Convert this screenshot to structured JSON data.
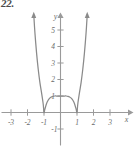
{
  "figure": {
    "exercise_number": "22.",
    "background_color": "#ffffff",
    "curve_color": "#8a8a8a",
    "axis_color": "#9a9a9a",
    "label_color": "#6b6b6b"
  },
  "chart_data": {
    "type": "line",
    "title": "",
    "subtitle": "",
    "xlabel": "x",
    "ylabel": "y",
    "xlim": [
      -3.6,
      3.9
    ],
    "ylim": [
      -1.8,
      6.3
    ],
    "grid": false,
    "legend": null,
    "x_ticks": [
      -3,
      -2,
      -1,
      1,
      2,
      3
    ],
    "x_tick_labels": [
      "-3",
      "-2",
      "-1",
      "1",
      "2",
      "3"
    ],
    "y_ticks": [
      -1,
      1,
      2,
      3,
      4,
      5
    ],
    "y_tick_labels": [
      "-1",
      "1",
      "2",
      "3",
      "4",
      "5"
    ],
    "series": [
      {
        "name": "quartic",
        "description": "W-shaped quartic with double roots at x=-1 and x=1 and a local maximum at (0, 1)",
        "x": [
          -1.62,
          -1.55,
          -1.45,
          -1.35,
          -1.25,
          -1.15,
          -1.05,
          -1.0,
          -0.95,
          -0.85,
          -0.75,
          -0.65,
          -0.55,
          -0.45,
          -0.35,
          -0.25,
          -0.15,
          0.0,
          0.15,
          0.25,
          0.35,
          0.45,
          0.55,
          0.65,
          0.75,
          0.85,
          0.95,
          1.0,
          1.05,
          1.15,
          1.25,
          1.35,
          1.45,
          1.55,
          1.62
        ],
        "y": [
          5.92,
          4.83,
          3.6,
          2.62,
          1.83,
          1.2,
          0.53,
          0.0,
          0.19,
          0.53,
          0.74,
          0.87,
          0.94,
          0.98,
          1.0,
          1.0,
          1.0,
          1.0,
          1.0,
          1.0,
          1.0,
          0.98,
          0.94,
          0.87,
          0.74,
          0.53,
          0.19,
          0.0,
          0.53,
          1.2,
          1.83,
          2.62,
          3.6,
          4.83,
          5.92
        ],
        "roots": [
          -1,
          1
        ],
        "local_maximum": {
          "x": 0,
          "y": 1
        },
        "local_minima": [
          {
            "x": -1,
            "y": 0
          },
          {
            "x": 1,
            "y": 0
          }
        ],
        "arrow_ends": [
          "up-left",
          "up-right"
        ]
      }
    ],
    "annotations": []
  }
}
